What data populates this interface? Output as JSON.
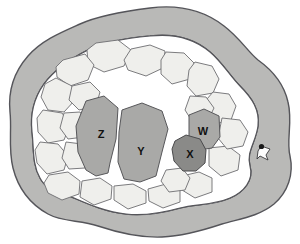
{
  "figure": {
    "type": "schematic-cross-section",
    "background_color": "#ffffff",
    "width": 300,
    "height": 244
  },
  "colors": {
    "outer_ring_fill": "#b9b9b7",
    "outer_ring_stroke": "#55555a",
    "inner_field_fill": "#ffffff",
    "tile_fill": "#efefec",
    "tile_stroke": "#6d6d70",
    "shaded_region_fill": "#a9a9a7",
    "shaded_region_stroke": "#57575a",
    "dark_region_fill": "#8a8a88",
    "dark_region_stroke": "#4a4a4c",
    "marker_fill": "#fdfdfd",
    "marker_stroke": "#3a3a3c",
    "marker_dot": "#1a1a1a",
    "label_color": "#111111"
  },
  "regions": [
    {
      "id": "region-z",
      "label": "Z",
      "shade": "medium",
      "label_x": 101,
      "label_y": 135,
      "path": "M 86 101 L 104 96 L 118 108 L 116 139 L 110 163 L 108 173 L 96 176 L 86 170 L 78 152 L 76 126 Z"
    },
    {
      "id": "region-y",
      "label": "Y",
      "shade": "medium",
      "label_x": 141,
      "label_y": 152,
      "path": "M 122 110 L 142 103 L 162 111 L 168 129 L 162 152 L 156 176 L 140 182 L 124 179 L 118 162 L 119 132 Z"
    },
    {
      "id": "region-w",
      "label": "W",
      "shade": "medium",
      "label_x": 203,
      "label_y": 132,
      "path": "M 189 115 L 204 109 L 219 116 L 220 137 L 212 148 L 199 150 L 189 140 Z"
    },
    {
      "id": "region-x",
      "label": "X",
      "shade": "dark",
      "label_x": 190,
      "label_y": 155,
      "path": "M 175 141 L 186 135 L 200 139 L 206 150 L 205 163 L 196 171 L 183 171 L 174 161 L 172 149 Z"
    }
  ],
  "marker": {
    "name": "edge-marker",
    "x": 261,
    "y": 146,
    "description": "small notch marker at right edge"
  },
  "tiles": [
    {
      "id": "tile-01",
      "path": "M 96 43 L 118 40 L 131 50 L 124 66 L 104 72 L 88 64 L 87 50 Z"
    },
    {
      "id": "tile-02",
      "path": "M 131 49 L 150 45 L 165 51 L 163 68 L 146 76 L 128 70 L 124 60 Z"
    },
    {
      "id": "tile-03",
      "path": "M 166 52 L 184 53 L 194 63 L 190 79 L 172 84 L 161 74 L 161 60 Z"
    },
    {
      "id": "tile-04",
      "path": "M 195 62 L 212 66 L 219 79 L 213 93 L 196 96 L 187 86 L 189 70 Z"
    },
    {
      "id": "tile-05",
      "path": "M 213 92 L 229 94 L 236 106 L 231 120 L 215 124 L 206 113 L 207 99 Z"
    },
    {
      "id": "tile-06",
      "path": "M 63 60 L 85 54 L 94 65 L 88 80 L 70 86 L 57 77 L 56 67 Z"
    },
    {
      "id": "tile-07",
      "path": "M 56 78 L 72 86 L 75 100 L 64 112 L 48 110 L 41 97 L 45 84 Z"
    },
    {
      "id": "tile-08",
      "path": "M 43 110 L 62 113 L 70 125 L 64 140 L 48 143 L 38 132 L 37 118 Z"
    },
    {
      "id": "tile-09",
      "path": "M 40 142 L 58 144 L 68 156 L 64 170 L 47 174 L 37 163 L 35 150 Z"
    },
    {
      "id": "tile-10",
      "path": "M 49 175 L 68 172 L 80 181 L 79 194 L 62 200 L 48 193 L 44 183 Z"
    },
    {
      "id": "tile-11",
      "path": "M 82 181 L 100 178 L 112 186 L 111 199 L 94 205 L 80 197 Z"
    },
    {
      "id": "tile-12",
      "path": "M 114 186 L 133 184 L 146 191 L 146 203 L 128 209 L 114 200 Z"
    },
    {
      "id": "tile-13",
      "path": "M 148 189 L 166 184 L 180 190 L 180 202 L 163 208 L 149 201 Z"
    },
    {
      "id": "tile-14",
      "path": "M 182 176 L 199 172 L 212 178 L 212 192 L 195 198 L 182 190 Z"
    },
    {
      "id": "tile-15",
      "path": "M 209 148 L 228 146 L 240 155 L 238 170 L 221 176 L 209 166 Z"
    },
    {
      "id": "tile-16",
      "path": "M 222 118 L 240 120 L 248 132 L 243 146 L 227 149 L 218 138 Z"
    },
    {
      "id": "tile-17",
      "path": "M 72 86 L 90 82 L 100 92 L 96 106 L 79 110 L 69 100 Z"
    },
    {
      "id": "tile-18",
      "path": "M 64 113 L 80 112 L 88 123 L 84 137 L 68 139 L 60 128 Z"
    },
    {
      "id": "tile-19",
      "path": "M 66 142 L 82 144 L 90 155 L 85 168 L 69 169 L 62 158 Z"
    },
    {
      "id": "tile-20",
      "path": "M 166 170 L 182 168 L 190 178 L 185 190 L 169 192 L 161 181 Z"
    },
    {
      "id": "tile-21",
      "path": "M 190 96 L 206 97 L 214 108 L 208 120 L 192 121 L 185 110 Z"
    }
  ],
  "outer_ring": {
    "outer_path": "M 150 8 C 181 4 206 12 224 26 C 240 38 248 52 258 60 C 272 70 284 84 288 102 C 293 122 286 140 290 156 C 294 174 288 192 274 204 C 258 217 238 219 222 224 C 204 230 184 236 162 237 C 138 238 116 232 98 226 C 80 220 62 222 48 214 C 30 204 18 188 13 168 C 8 148 12 130 10 112 C 8 92 14 72 28 56 C 42 40 62 32 80 24 C 100 15 126 11 150 8 Z",
    "inner_path": "M 150 36 C 176 33 196 40 210 52 C 222 62 230 76 240 86 C 252 98 260 110 258 126 C 256 142 246 152 250 166 C 254 180 244 192 230 198 C 214 205 196 204 180 208 C 162 213 144 216 126 214 C 106 212 88 204 74 198 C 58 191 46 190 40 178 C 32 164 34 148 32 132 C 30 114 34 98 44 84 C 56 68 72 58 88 50 C 106 41 128 38 150 36 Z"
  }
}
